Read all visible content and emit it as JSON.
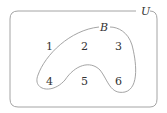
{
  "diagram": {
    "type": "venn",
    "universe": {
      "label": "U"
    },
    "sets": [
      {
        "label": "B",
        "elements": [
          "2",
          "3",
          "4",
          "5",
          "6"
        ]
      }
    ],
    "outside": [
      "1"
    ],
    "elements": [
      {
        "label": "1",
        "x": 49,
        "y": 46
      },
      {
        "label": "2",
        "x": 84,
        "y": 46
      },
      {
        "label": "3",
        "x": 118,
        "y": 46
      },
      {
        "label": "4",
        "x": 49,
        "y": 81
      },
      {
        "label": "5",
        "x": 84,
        "y": 81
      },
      {
        "label": "6",
        "x": 118,
        "y": 81
      }
    ],
    "colors": {
      "stroke": "#9a9a9a",
      "text": "#333333"
    }
  }
}
